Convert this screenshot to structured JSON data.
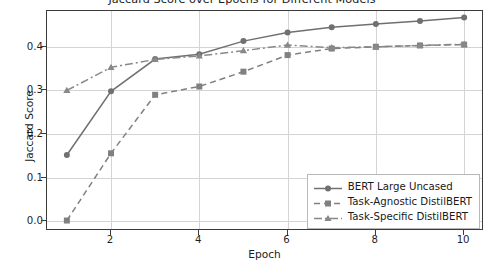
{
  "chart_data": {
    "type": "line",
    "title": "Jaccard Score over Epochs for Different Models",
    "xlabel": "Epoch",
    "ylabel": "Jaccard Score",
    "x": [
      1,
      2,
      3,
      4,
      5,
      6,
      7,
      8,
      9,
      10
    ],
    "xlim": [
      0.55,
      10.45
    ],
    "ylim": [
      -0.022,
      0.482
    ],
    "xticks": [
      "2",
      "4",
      "6",
      "8",
      "10"
    ],
    "xtick_values": [
      2,
      4,
      6,
      8,
      10
    ],
    "yticks": [
      "0.0",
      "0.1",
      "0.2",
      "0.3",
      "0.4"
    ],
    "ytick_values": [
      0.0,
      0.1,
      0.2,
      0.3,
      0.4
    ],
    "grid": true,
    "legend_position": "lower right",
    "series": [
      {
        "name": "BERT Large Uncased",
        "values": [
          0.152,
          0.298,
          0.372,
          0.383,
          0.413,
          0.433,
          0.445,
          0.452,
          0.459,
          0.467
        ],
        "color": "#707070",
        "linestyle": "solid",
        "marker": "circle"
      },
      {
        "name": "Task-Agnostic DistilBERT",
        "values": [
          0.002,
          0.156,
          0.29,
          0.309,
          0.343,
          0.381,
          0.396,
          0.4,
          0.403,
          0.405
        ],
        "color": "#808080",
        "linestyle": "dashed",
        "marker": "square"
      },
      {
        "name": "Task-Specific DistilBERT",
        "values": [
          0.3,
          0.353,
          0.371,
          0.379,
          0.391,
          0.404,
          0.398,
          0.4,
          0.403,
          0.406
        ],
        "color": "#888888",
        "linestyle": "dashdot",
        "marker": "triangle"
      }
    ]
  },
  "figure": {
    "background": "#ffffff",
    "axes_color": "#3b3b3b",
    "grid_color": "#d4d4d4"
  }
}
